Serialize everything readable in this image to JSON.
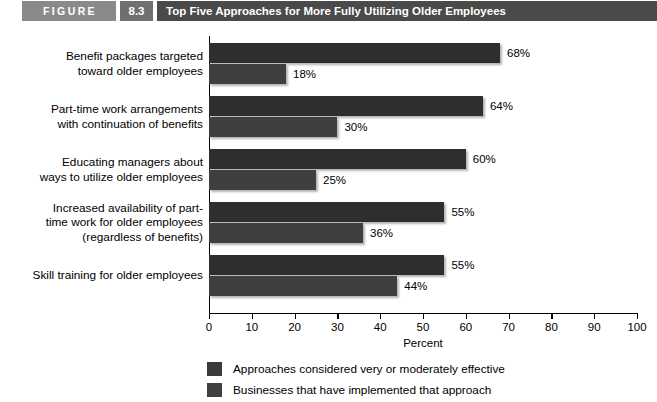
{
  "header": {
    "figure_label": "FIGURE",
    "figure_number": "8.3",
    "title": "Top Five Approaches for More Fully Utilizing Older Employees"
  },
  "chart_data": {
    "type": "bar",
    "orientation": "horizontal",
    "title": "Top Five Approaches for More Fully Utilizing Older Employees",
    "xlabel": "Percent",
    "ylabel": "",
    "xlim": [
      0,
      100
    ],
    "xticks": [
      0,
      10,
      20,
      30,
      40,
      50,
      60,
      70,
      80,
      90,
      100
    ],
    "xtick_labels": [
      "0",
      "10",
      "20",
      "30",
      "40",
      "50",
      "60",
      "70",
      "80",
      "90",
      "100"
    ],
    "grid": false,
    "legend_position": "bottom",
    "categories": [
      "Benefit packages targeted toward older employees",
      "Part-time work arrangements with continuation of benefits",
      "Educating managers about ways to utilize older employees",
      "Increased availability of part-time work for older employees (regardless of benefits)",
      "Skill training for older employees"
    ],
    "category_label_lines": [
      [
        "Benefit packages targeted",
        "toward older employees"
      ],
      [
        "Part-time work arrangements",
        "with continuation of benefits"
      ],
      [
        "Educating managers about",
        "ways to utilize older employees"
      ],
      [
        "Increased availability of part-",
        "time work for older employees",
        "(regardless of benefits)"
      ],
      [
        "Skill training for older employees"
      ]
    ],
    "series": [
      {
        "name": "Approaches considered very or moderately effective",
        "color": "#2e2e2e",
        "values": [
          68,
          64,
          60,
          55,
          55
        ],
        "value_labels": [
          "68%",
          "64%",
          "60%",
          "55%",
          "55%"
        ]
      },
      {
        "name": "Businesses that have implemented that approach",
        "color": "#3f3f3f",
        "values": [
          18,
          30,
          25,
          36,
          44
        ],
        "value_labels": [
          "18%",
          "30%",
          "25%",
          "36%",
          "44%"
        ]
      }
    ]
  },
  "legend": {
    "items": [
      {
        "label": "Approaches considered very or moderately effective"
      },
      {
        "label": "Businesses that have implemented that approach"
      }
    ]
  }
}
